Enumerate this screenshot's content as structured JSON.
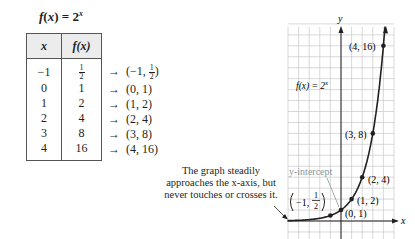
{
  "title": {
    "fx": "f",
    "paren_open": "(",
    "x": "x",
    "paren_close": ")",
    "equals": " = 2",
    "exp": "x"
  },
  "table": {
    "headers": [
      "x",
      "f(x)"
    ],
    "rows": [
      {
        "x": "−1",
        "fx_num": "1",
        "fx_den": "2",
        "point_pre": "(−1, ",
        "point_num": "1",
        "point_den": "2",
        "point_post": ")"
      },
      {
        "x": "0",
        "fx": "1",
        "point": "(0, 1)"
      },
      {
        "x": "1",
        "fx": "2",
        "point": "(1, 2)"
      },
      {
        "x": "2",
        "fx": "4",
        "point": "(2, 4)"
      },
      {
        "x": "3",
        "fx": "8",
        "point": "(3, 8)"
      },
      {
        "x": "4",
        "fx": "16",
        "point": "(4, 16)"
      }
    ],
    "arrow": "→"
  },
  "note": "The graph steadily approaches the x-axis, but never touches or crosses it.",
  "chart_data": {
    "type": "line",
    "xlabel": "x",
    "ylabel": "y",
    "xlim": [
      -5,
      5
    ],
    "ylim": [
      -1.6,
      18
    ],
    "grid": true,
    "series": [
      {
        "name": "f(x) = 2^x",
        "x": [
          -5,
          -4,
          -3,
          -2,
          -1,
          0,
          1,
          2,
          3,
          4,
          4.2
        ],
        "y": [
          0.03125,
          0.0625,
          0.125,
          0.25,
          0.5,
          1,
          2,
          4,
          8,
          16,
          18.4
        ]
      }
    ],
    "points": [
      {
        "x": -1,
        "y": 0.5,
        "label": "(−1, 1/2)"
      },
      {
        "x": 0,
        "y": 1,
        "label": "(0, 1)"
      },
      {
        "x": 1,
        "y": 2,
        "label": "(1, 2)"
      },
      {
        "x": 2,
        "y": 4,
        "label": "(2, 4)"
      },
      {
        "x": 3,
        "y": 8,
        "label": "(3, 8)"
      },
      {
        "x": 4,
        "y": 16,
        "label": "(4, 16)"
      }
    ],
    "annotations": [
      "f(x) = 2^x",
      "y-intercept",
      "The graph steadily approaches the x-axis, but never touches or crosses it."
    ]
  },
  "graph": {
    "func_label": "f(x) = 2",
    "func_exp": "x",
    "y_intercept_label": "y-intercept",
    "axis_x": "x",
    "axis_y": "y",
    "labels": {
      "p0": "(0, 1)",
      "p1": "(1, 2)",
      "p2": "(2, 4)",
      "p3": "(3, 8)",
      "p4": "(4, 16)",
      "pm1_pre": "−1,",
      "pm1_num": "1",
      "pm1_den": "2"
    },
    "colors": {
      "grid": "#c8c8c8",
      "curve": "#231f20",
      "y_intercept": "#8a9499",
      "header_bg": "#ececec"
    }
  }
}
